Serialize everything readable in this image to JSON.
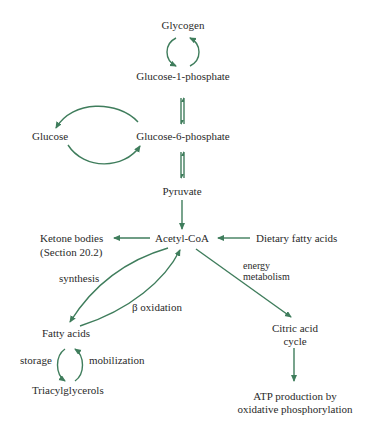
{
  "diagram": {
    "arrow_color": "#3f7d5c",
    "nodes": {
      "glycogen": "Glycogen",
      "glucose_1_phosphate": "Glucose-1-phosphate",
      "glucose": "Glucose",
      "glucose_6_phosphate": "Glucose-6-phosphate",
      "pyruvate": "Pyruvate",
      "ketone_bodies_line1": "Ketone bodies",
      "ketone_bodies_line2": "(Section 20.2)",
      "acetyl_coa": "Acetyl-CoA",
      "dietary_fatty_acids": "Dietary fatty acids",
      "fatty_acids": "Fatty acids",
      "triacylglycerols": "Triacylglycerols",
      "citric_acid_cycle_line1": "Citric acid",
      "citric_acid_cycle_line2": "cycle",
      "atp_line1": "ATP production by",
      "atp_line2": "oxidative phosphorylation"
    },
    "edge_labels": {
      "synthesis": "synthesis",
      "beta_oxidation": "β oxidation",
      "energy_line1": "energy",
      "energy_line2": "metabolism",
      "storage": "storage",
      "mobilization": "mobilization"
    }
  }
}
